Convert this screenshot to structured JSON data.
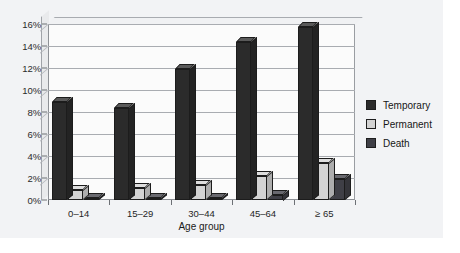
{
  "chart_data": {
    "type": "bar",
    "title": "",
    "subtitle": "",
    "xlabel": "Age group",
    "ylabel": "",
    "categories": [
      "0–14",
      "15–29",
      "30–44",
      "45–64",
      "≥ 65"
    ],
    "series": [
      {
        "name": "Temporary",
        "color": "#2b2b2b",
        "values": [
          8.9,
          8.4,
          11.9,
          14.4,
          15.7
        ]
      },
      {
        "name": "Permanent",
        "color": "#d3d3d3",
        "values": [
          0.9,
          1.1,
          1.4,
          2.2,
          3.4
        ]
      },
      {
        "name": "Death",
        "color": "#3f3f46",
        "values": [
          0.1,
          0.15,
          0.1,
          0.5,
          1.9
        ]
      }
    ],
    "ylim": [
      0,
      16
    ],
    "ytick_values": [
      0,
      2,
      4,
      6,
      8,
      10,
      12,
      14,
      16
    ],
    "ytick_labels": [
      "0%",
      "2%",
      "4%",
      "6%",
      "8%",
      "10%",
      "12%",
      "14%",
      "16%"
    ],
    "grid": true,
    "grid_axis": "y",
    "legend_position": "right",
    "three_d": true,
    "annotations": []
  },
  "legend": {
    "items": [
      {
        "label": "Temporary",
        "color": "#2b2b2b"
      },
      {
        "label": "Permanent",
        "color": "#d3d3d3"
      },
      {
        "label": "Death",
        "color": "#3f3f46"
      }
    ]
  },
  "figure": {
    "background": "#f2f3f5",
    "plot_background": "#fbfbfb",
    "axis_color": "#8d9095",
    "grid_color": "#a9acb1"
  }
}
